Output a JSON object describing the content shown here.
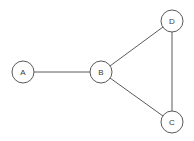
{
  "diagram": {
    "background_color": "#ffffff",
    "stroke_color": "#5a5a5a",
    "node_fill_color": "#ffffff",
    "label_color": "#3a3a3a",
    "node_radius": 11,
    "width": 194,
    "height": 141
  },
  "nodes": [
    {
      "id": "A",
      "label": "A",
      "cx": 23,
      "cy": 72,
      "r": 11
    },
    {
      "id": "B",
      "label": "B",
      "cx": 101,
      "cy": 72,
      "r": 11
    },
    {
      "id": "C",
      "label": "C",
      "cx": 172,
      "cy": 122,
      "r": 11
    },
    {
      "id": "D",
      "label": "D",
      "cx": 172,
      "cy": 21,
      "r": 11
    }
  ],
  "edges": [
    {
      "id": "A-B",
      "from": "A",
      "to": "B",
      "x1": 34,
      "y1": 72,
      "x2": 90,
      "y2": 72
    },
    {
      "id": "B-D",
      "from": "B",
      "to": "D",
      "x1": 110,
      "y1": 66,
      "x2": 163,
      "y2": 27
    },
    {
      "id": "B-C",
      "from": "B",
      "to": "C",
      "x1": 110,
      "y1": 78,
      "x2": 163,
      "y2": 116
    },
    {
      "id": "D-C",
      "from": "D",
      "to": "C",
      "x1": 172,
      "y1": 32,
      "x2": 172,
      "y2": 111
    }
  ],
  "chart_data": {
    "type": "diagram",
    "graph_type": "undirected",
    "node_labels": [
      "A",
      "B",
      "C",
      "D"
    ],
    "edge_list": [
      [
        "A",
        "B"
      ],
      [
        "B",
        "D"
      ],
      [
        "B",
        "C"
      ],
      [
        "D",
        "C"
      ]
    ],
    "node_count": 4,
    "edge_count": 4,
    "degrees": {
      "A": 1,
      "B": 3,
      "C": 2,
      "D": 2
    },
    "node_positions": {
      "A": [
        23,
        72
      ],
      "B": [
        101,
        72
      ],
      "C": [
        172,
        122
      ],
      "D": [
        172,
        21
      ]
    }
  }
}
